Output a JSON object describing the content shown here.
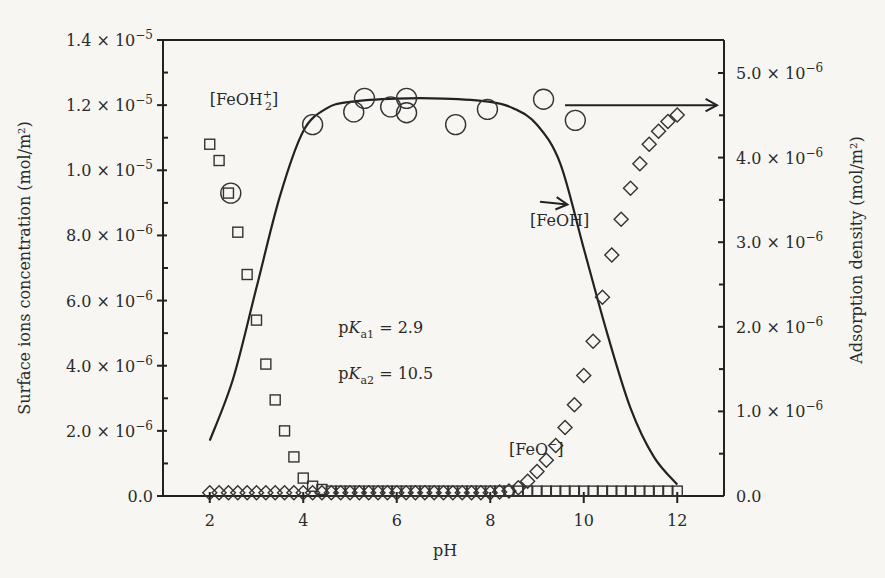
{
  "chart_data": {
    "type": "scatter",
    "title": "",
    "xlabel": "pH",
    "ylabel_left": "Surface ions concentration (mol/m²)",
    "ylabel_right": "Adsorption density (mol/m²)",
    "xlim": [
      1,
      13
    ],
    "ylim_left": [
      0,
      1.4e-05
    ],
    "ylim_right": [
      0,
      5.39e-06
    ],
    "x_ticks": [
      2,
      4,
      6,
      8,
      10,
      12
    ],
    "x_tick_labels": [
      "2",
      "4",
      "6",
      "8",
      "10",
      "12"
    ],
    "y_left_ticks": [
      0,
      2e-06,
      4e-06,
      6e-06,
      8e-06,
      1e-05,
      1.2e-05,
      1.4e-05
    ],
    "y_left_tick_labels": [
      {
        "mant": "0.0",
        "exp": ""
      },
      {
        "mant": "2.0 × 10",
        "exp": "−6"
      },
      {
        "mant": "4.0 × 10",
        "exp": "−6"
      },
      {
        "mant": "6.0 × 10",
        "exp": "−6"
      },
      {
        "mant": "8.0 × 10",
        "exp": "−6"
      },
      {
        "mant": "1.0 × 10",
        "exp": "−5"
      },
      {
        "mant": "1.2 × 10",
        "exp": "−5"
      },
      {
        "mant": "1.4 × 10",
        "exp": "−5"
      }
    ],
    "y_right_ticks": [
      0,
      1e-06,
      2e-06,
      3e-06,
      4e-06,
      5e-06
    ],
    "y_right_tick_labels": [
      {
        "mant": "0.0",
        "exp": ""
      },
      {
        "mant": "1.0 × 10",
        "exp": "−6"
      },
      {
        "mant": "2.0 × 10",
        "exp": "−6"
      },
      {
        "mant": "3.0 × 10",
        "exp": "−6"
      },
      {
        "mant": "4.0 × 10",
        "exp": "−6"
      },
      {
        "mant": "5.0 × 10",
        "exp": "−6"
      }
    ],
    "grid": false,
    "series": [
      {
        "name": "[FeOH2+]",
        "axis": "left",
        "marker": "square",
        "x": [
          2.0,
          2.2,
          2.4,
          2.6,
          2.8,
          3.0,
          3.2,
          3.4,
          3.6,
          3.8,
          4.0,
          4.2,
          4.4,
          4.6,
          4.8,
          5.0,
          5.2,
          5.4,
          5.6,
          5.8,
          6.0,
          6.2,
          6.4,
          6.6,
          6.8,
          7.0,
          7.2,
          7.4,
          7.6,
          7.8,
          8.0,
          8.2,
          8.4,
          8.6,
          8.8,
          9.0,
          9.2,
          9.4,
          9.6,
          9.8,
          10.0,
          10.2,
          10.4,
          10.6,
          10.8,
          11.0,
          11.2,
          11.4,
          11.6,
          11.8,
          12.0
        ],
        "y": [
          1.08e-05,
          1.03e-05,
          9.3e-06,
          8.1e-06,
          6.8e-06,
          5.4e-06,
          4.05e-06,
          2.95e-06,
          2e-06,
          1.2e-06,
          5.5e-07,
          3e-07,
          2e-07,
          1.5e-07,
          1.5e-07,
          1.5e-07,
          1.5e-07,
          1.5e-07,
          1.5e-07,
          1.5e-07,
          1.5e-07,
          1.5e-07,
          1.5e-07,
          1.5e-07,
          1.5e-07,
          1.5e-07,
          1.5e-07,
          1.5e-07,
          1.5e-07,
          1.5e-07,
          1.5e-07,
          1.5e-07,
          1.5e-07,
          1.5e-07,
          1.5e-07,
          1.5e-07,
          1.5e-07,
          1.5e-07,
          1.5e-07,
          1.5e-07,
          1.5e-07,
          1.5e-07,
          1.5e-07,
          1.5e-07,
          1.5e-07,
          1.5e-07,
          1.5e-07,
          1.5e-07,
          1.5e-07,
          1.5e-07,
          1.5e-07
        ]
      },
      {
        "name": "[FeO-]",
        "axis": "left",
        "marker": "diamond",
        "x": [
          2.0,
          2.2,
          2.4,
          2.6,
          2.8,
          3.0,
          3.2,
          3.4,
          3.6,
          3.8,
          4.0,
          4.2,
          4.4,
          4.6,
          4.8,
          5.0,
          5.2,
          5.4,
          5.6,
          5.8,
          6.0,
          6.2,
          6.4,
          6.6,
          6.8,
          7.0,
          7.2,
          7.4,
          7.6,
          7.8,
          8.0,
          8.2,
          8.4,
          8.6,
          8.8,
          9.0,
          9.2,
          9.4,
          9.6,
          9.8,
          10.0,
          10.2,
          10.4,
          10.6,
          10.8,
          11.0,
          11.2,
          11.4,
          11.6,
          11.8,
          12.0
        ],
        "y": [
          1e-07,
          1e-07,
          1e-07,
          1e-07,
          1e-07,
          1e-07,
          1e-07,
          1e-07,
          1e-07,
          1e-07,
          1e-07,
          1e-07,
          1e-07,
          1e-07,
          1e-07,
          1e-07,
          1e-07,
          1e-07,
          1e-07,
          1e-07,
          1e-07,
          1e-07,
          1e-07,
          1e-07,
          1e-07,
          1e-07,
          1e-07,
          1e-07,
          1e-07,
          1e-07,
          1e-07,
          1.2e-07,
          1.5e-07,
          2.5e-07,
          4.5e-07,
          7.5e-07,
          1.1e-06,
          1.55e-06,
          2.1e-06,
          2.8e-06,
          3.7e-06,
          4.75e-06,
          6.1e-06,
          7.4e-06,
          8.5e-06,
          9.45e-06,
          1.02e-05,
          1.08e-05,
          1.12e-05,
          1.15e-05,
          1.17e-05
        ]
      },
      {
        "name": "[FeOH]",
        "axis": "left",
        "marker": "line",
        "x": [
          2.0,
          2.5,
          3.0,
          3.5,
          4.0,
          4.5,
          5.0,
          6.0,
          7.0,
          8.0,
          8.5,
          9.0,
          9.5,
          10.0,
          10.5,
          11.0,
          11.5,
          12.0
        ],
        "y": [
          1.7e-06,
          3.6e-06,
          6.4e-06,
          9.2e-06,
          1.12e-05,
          1.19e-05,
          1.21e-05,
          1.22e-05,
          1.22e-05,
          1.21e-05,
          1.19e-05,
          1.14e-05,
          1.02e-05,
          7.6e-06,
          5e-06,
          2.7e-06,
          1.2e-06,
          3.5e-07
        ]
      },
      {
        "name": "Adsorption density",
        "axis": "right",
        "marker": "circle",
        "x": [
          2.45,
          4.2,
          5.08,
          5.31,
          5.87,
          6.21,
          6.21,
          7.26,
          7.94,
          9.14,
          9.82
        ],
        "y": [
          3.58e-06,
          4.39e-06,
          4.54e-06,
          4.7e-06,
          4.6e-06,
          4.7e-06,
          4.53e-06,
          4.39e-06,
          4.57e-06,
          4.69e-06,
          4.44e-06
        ]
      }
    ],
    "annotations": [
      {
        "id": "feoh2",
        "text": "[FeOH",
        "sub": "2",
        "sup": "+",
        "tail": "]",
        "x": 2.0,
        "y": 1.2e-05
      },
      {
        "id": "feoh",
        "text": "[FeOH]",
        "x": 8.85,
        "y": 8.3e-06,
        "arrow_to": [
          9.65,
          8.95e-06
        ]
      },
      {
        "id": "feo",
        "text": "[FeO",
        "sup": "−",
        "tail": "]",
        "x": 8.4,
        "y": 1.25e-06
      },
      {
        "id": "pka1",
        "text": "pK",
        "sub": "a1",
        "tail": " = 2.9",
        "x": 4.75,
        "y": 5e-06
      },
      {
        "id": "pka2",
        "text": "pK",
        "sub": "a2",
        "tail": " = 10.5",
        "x": 4.75,
        "y": 3.6e-06
      },
      {
        "id": "right-arrow",
        "text": "",
        "x": 9.6,
        "y": 1.2e-05,
        "arrow_to": [
          12.85,
          1.2e-05
        ]
      }
    ]
  }
}
